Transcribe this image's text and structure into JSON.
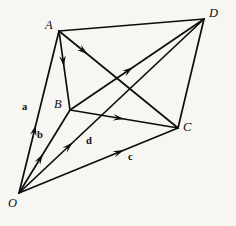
{
  "figure": {
    "background_color": "#f7f6f3",
    "line_color": "#0d0d0d",
    "width": 236,
    "height": 226,
    "vertices": [
      {
        "id": "O",
        "label": "O",
        "x": 19,
        "y": 193,
        "label_x": 8,
        "label_y": 197
      },
      {
        "id": "A",
        "label": "A",
        "x": 59,
        "y": 31,
        "label_x": 45,
        "label_y": 19
      },
      {
        "id": "B",
        "label": "B",
        "x": 70,
        "y": 110,
        "label_x": 54,
        "label_y": 98
      },
      {
        "id": "C",
        "label": "C",
        "x": 178,
        "y": 128,
        "label_x": 183,
        "label_y": 121
      },
      {
        "id": "D",
        "label": "D",
        "x": 204,
        "y": 19,
        "label_x": 209,
        "label_y": 7
      }
    ],
    "plain_edges": [
      {
        "name": "edge-A-D",
        "from": "A",
        "to": "D"
      },
      {
        "name": "edge-D-C",
        "from": "D",
        "to": "C"
      }
    ],
    "vector_edges": [
      {
        "name": "vector-O-A",
        "from": "O",
        "to": "A",
        "label": "a",
        "label_x": 22,
        "label_y": 102,
        "arrow_t": 0.42
      },
      {
        "name": "vector-O-B",
        "from": "O",
        "to": "B",
        "label": "b",
        "label_x": 37,
        "label_y": 130,
        "arrow_t": 0.47
      },
      {
        "name": "vector-O-D",
        "from": "O",
        "to": "D",
        "label": "d",
        "label_x": 86,
        "label_y": 136,
        "arrow_t": 0.29
      },
      {
        "name": "vector-O-C",
        "from": "O",
        "to": "C",
        "label": "c",
        "label_x": 128,
        "label_y": 152,
        "arrow_t": 0.66
      },
      {
        "name": "vector-A-B",
        "from": "A",
        "to": "B",
        "label": "",
        "label_x": 0,
        "label_y": 0,
        "arrow_t": 0.45
      },
      {
        "name": "vector-A-C",
        "from": "A",
        "to": "C",
        "label": "",
        "label_x": 0,
        "label_y": 0,
        "arrow_t": 0.24
      },
      {
        "name": "vector-B-D",
        "from": "B",
        "to": "D",
        "label": "",
        "label_x": 0,
        "label_y": 0,
        "arrow_t": 0.47
      },
      {
        "name": "vector-B-C",
        "from": "B",
        "to": "C",
        "label": "",
        "label_x": 0,
        "label_y": 0,
        "arrow_t": 0.5
      }
    ]
  }
}
